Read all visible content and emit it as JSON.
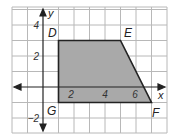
{
  "diagram": {
    "type": "coordinate-plane-polygon",
    "axes": {
      "x_label": "x",
      "y_label": "y",
      "x_range": [
        -2,
        8
      ],
      "y_range": [
        -3,
        5
      ],
      "x_tick_labels": [
        "2",
        "4",
        "6"
      ],
      "y_tick_labels": [
        "4",
        "2",
        "−2"
      ],
      "grid": true
    },
    "polygon": {
      "name": "DEFG",
      "fill_color": "#a9a9a9",
      "stroke_color": "#222222",
      "vertices": [
        {
          "label": "D",
          "x": 1,
          "y": 3
        },
        {
          "label": "E",
          "x": 5,
          "y": 3
        },
        {
          "label": "F",
          "x": 7,
          "y": -1
        },
        {
          "label": "G",
          "x": 1,
          "y": -1
        }
      ]
    },
    "colors": {
      "grid": "#b8b8b8",
      "axis": "#222222",
      "background": "#ffffff"
    }
  }
}
